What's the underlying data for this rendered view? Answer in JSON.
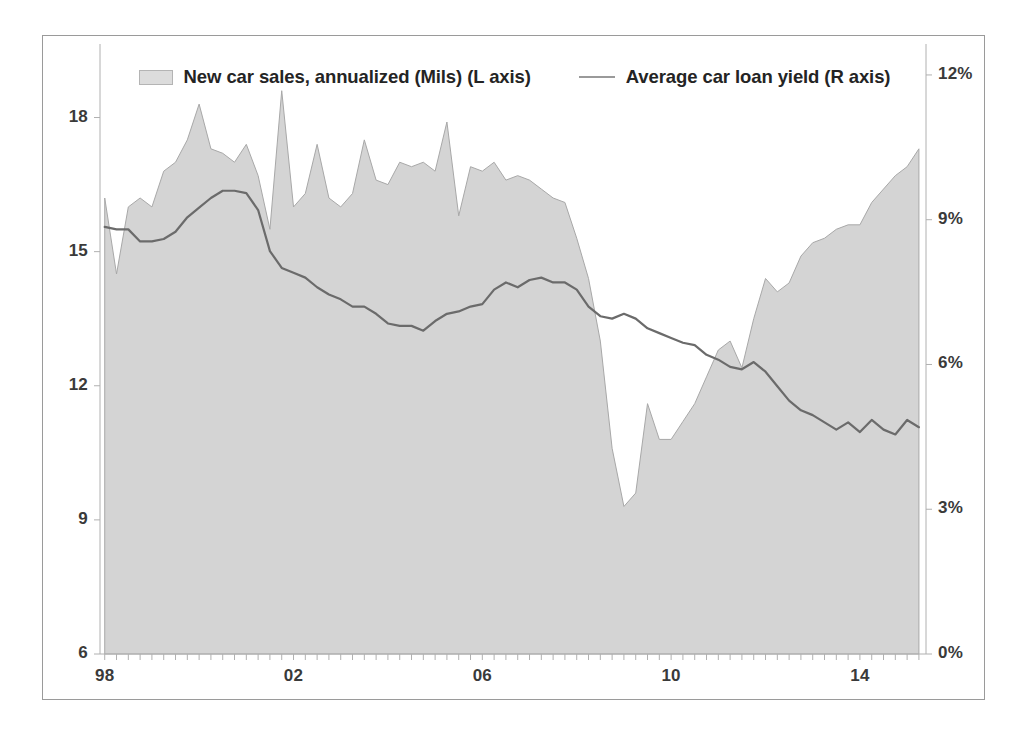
{
  "chart_data": {
    "type": "area",
    "title": "",
    "subtitle": "",
    "xlabel": "",
    "ylabel": "",
    "grid": false,
    "legend_position": "top-center",
    "x_tick_labels": [
      "98",
      "02",
      "06",
      "10",
      "14"
    ],
    "x_tick_values": [
      1998,
      2002,
      2006,
      2010,
      2014
    ],
    "x_range": [
      1997.9,
      2015.4
    ],
    "left_axis": {
      "label": "New car sales, annualized (Mils)",
      "tick_labels": [
        "6",
        "9",
        "12",
        "15",
        "18"
      ],
      "tick_values": [
        6,
        9,
        12,
        15,
        18
      ],
      "ylim": [
        6,
        19.6
      ]
    },
    "right_axis": {
      "label": "Average car loan yield",
      "tick_labels": [
        "0%",
        "3%",
        "6%",
        "9%",
        "12%"
      ],
      "tick_values": [
        0,
        3,
        6,
        9,
        12
      ],
      "ylim": [
        0,
        12.6
      ]
    },
    "x": [
      1998.0,
      1998.25,
      1998.5,
      1998.75,
      1999.0,
      1999.25,
      1999.5,
      1999.75,
      2000.0,
      2000.25,
      2000.5,
      2000.75,
      2001.0,
      2001.25,
      2001.5,
      2001.75,
      2002.0,
      2002.25,
      2002.5,
      2002.75,
      2003.0,
      2003.25,
      2003.5,
      2003.75,
      2004.0,
      2004.25,
      2004.5,
      2004.75,
      2005.0,
      2005.25,
      2005.5,
      2005.75,
      2006.0,
      2006.25,
      2006.5,
      2006.75,
      2007.0,
      2007.25,
      2007.5,
      2007.75,
      2008.0,
      2008.25,
      2008.5,
      2008.75,
      2009.0,
      2009.25,
      2009.5,
      2009.75,
      2010.0,
      2010.25,
      2010.5,
      2010.75,
      2011.0,
      2011.25,
      2011.5,
      2011.75,
      2012.0,
      2012.25,
      2012.5,
      2012.75,
      2013.0,
      2013.25,
      2013.5,
      2013.75,
      2014.0,
      2014.25,
      2014.5,
      2014.75,
      2015.0,
      2015.25
    ],
    "series": [
      {
        "name": "New car sales, annualized (Mils)",
        "axis": "left",
        "type": "area",
        "fill_color": "#d4d4d4",
        "line_color": "#a8a8a8",
        "values": [
          16.2,
          14.5,
          16.0,
          16.2,
          16.0,
          16.8,
          17.0,
          17.5,
          18.3,
          17.3,
          17.2,
          17.0,
          17.4,
          16.7,
          15.5,
          18.6,
          16.0,
          16.3,
          17.4,
          16.2,
          16.0,
          16.3,
          17.5,
          16.6,
          16.5,
          17.0,
          16.9,
          17.0,
          16.8,
          17.9,
          15.8,
          16.9,
          16.8,
          17.0,
          16.6,
          16.7,
          16.6,
          16.4,
          16.2,
          16.1,
          15.3,
          14.4,
          13.0,
          10.6,
          9.3,
          9.6,
          11.6,
          10.8,
          10.8,
          11.2,
          11.6,
          12.2,
          12.8,
          13.0,
          12.4,
          13.5,
          14.4,
          14.1,
          14.3,
          14.9,
          15.2,
          15.3,
          15.5,
          15.6,
          15.6,
          16.1,
          16.4,
          16.7,
          16.9,
          17.3
        ]
      },
      {
        "name": "Average car loan yield",
        "axis": "right",
        "type": "line",
        "line_color": "#6b6b6b",
        "values": [
          8.85,
          8.8,
          8.8,
          8.55,
          8.55,
          8.6,
          8.75,
          9.05,
          9.25,
          9.45,
          9.6,
          9.6,
          9.55,
          9.2,
          8.35,
          8.0,
          7.9,
          7.8,
          7.6,
          7.45,
          7.35,
          7.2,
          7.2,
          7.05,
          6.85,
          6.8,
          6.8,
          6.7,
          6.9,
          7.05,
          7.1,
          7.2,
          7.25,
          7.55,
          7.7,
          7.6,
          7.75,
          7.8,
          7.7,
          7.7,
          7.55,
          7.2,
          7.0,
          6.95,
          7.05,
          6.95,
          6.75,
          6.65,
          6.55,
          6.45,
          6.4,
          6.2,
          6.1,
          5.95,
          5.9,
          6.05,
          5.85,
          5.55,
          5.25,
          5.05,
          4.95,
          4.8,
          4.65,
          4.8,
          4.6,
          4.85,
          4.65,
          4.55,
          4.85,
          4.7
        ]
      }
    ]
  },
  "legend": {
    "entries": [
      {
        "label": "New car sales, annualized (Mils) (L axis)",
        "marker": "area-swatch-icon"
      },
      {
        "label": "Average car loan yield  (R axis)",
        "marker": "line-swatch-icon"
      }
    ]
  },
  "colors": {
    "area_fill": "#d4d4d4",
    "area_stroke": "#a8a8a8",
    "yield_line": "#6b6b6b",
    "axis": "#b0b0b0",
    "frame": "#9a9a9a",
    "text": "#303030"
  }
}
